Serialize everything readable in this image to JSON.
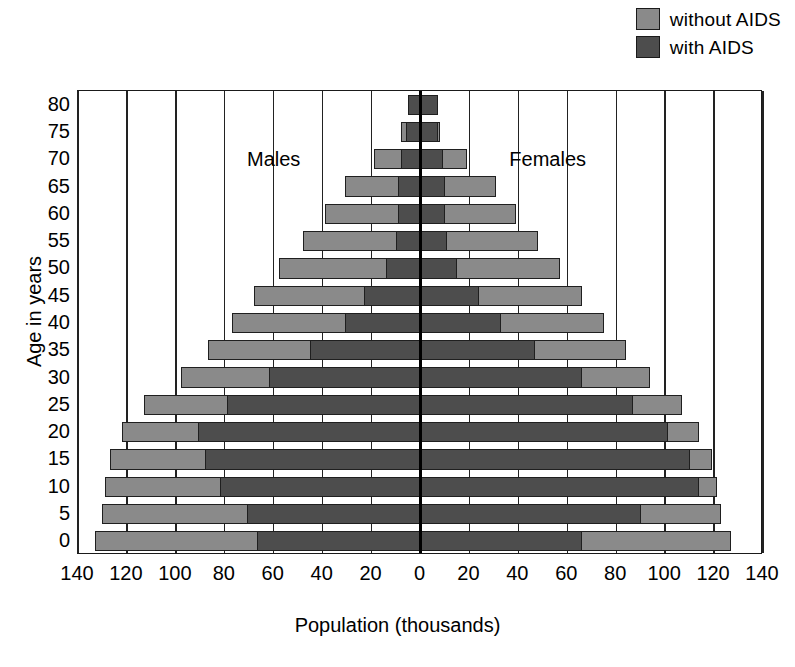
{
  "chart_data": {
    "type": "bar",
    "subtype": "population-pyramid",
    "title": "",
    "xlabel": "Population (thousands)",
    "ylabel": "Age in years",
    "xlim": [
      -140,
      140
    ],
    "xticks": [
      140,
      120,
      100,
      80,
      60,
      40,
      20,
      0,
      20,
      40,
      60,
      80,
      100,
      120,
      140
    ],
    "xtick_values": [
      -140,
      -120,
      -100,
      -80,
      -60,
      -40,
      -20,
      0,
      20,
      40,
      60,
      80,
      100,
      120,
      140
    ],
    "categories": [
      "0",
      "5",
      "10",
      "15",
      "20",
      "25",
      "30",
      "35",
      "40",
      "45",
      "50",
      "55",
      "60",
      "65",
      "70",
      "75",
      "80"
    ],
    "grid": true,
    "legend_position": "top-right",
    "legend": [
      {
        "label": "without AIDS",
        "color": "#8a8a8a"
      },
      {
        "label": "with AIDS",
        "color": "#4d4d4d"
      }
    ],
    "side_labels": [
      {
        "text": "Males",
        "side": "left"
      },
      {
        "text": "Females",
        "side": "right"
      }
    ],
    "series": [
      {
        "name": "without AIDS",
        "color": "#8a8a8a",
        "males": [
          133,
          130,
          129,
          127,
          122,
          113,
          98,
          87,
          77,
          68,
          58,
          48,
          39,
          31,
          19,
          8,
          4
        ],
        "females": [
          127,
          123,
          121,
          119,
          114,
          107,
          94,
          84,
          75,
          66,
          57,
          48,
          39,
          31,
          19,
          8,
          4
        ]
      },
      {
        "name": "with AIDS",
        "color": "#4d4d4d",
        "males": [
          67,
          71,
          82,
          88,
          91,
          79,
          62,
          45,
          31,
          23,
          14,
          10,
          9,
          9,
          8,
          6,
          5
        ],
        "females": [
          66,
          90,
          114,
          110,
          101,
          87,
          66,
          47,
          33,
          24,
          15,
          11,
          10,
          10,
          9,
          7,
          7
        ]
      }
    ],
    "note": "males plotted to the left of zero, females to the right"
  },
  "legend": {
    "items": [
      {
        "label": "without AIDS",
        "swatch": "light-gray-swatch"
      },
      {
        "label": "with AIDS",
        "swatch": "dark-gray-swatch"
      }
    ]
  },
  "axes": {
    "y_title": "Age in years",
    "x_title": "Population (thousands)"
  }
}
